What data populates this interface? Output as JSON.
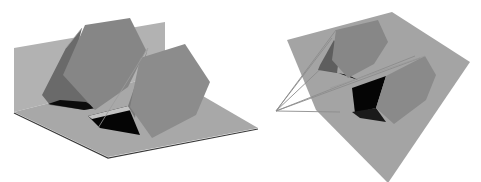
{
  "figure": {
    "colors": {
      "background": "#ffffff",
      "plane": "#a6a6a6",
      "plane_back": "#b4b4b4",
      "prism_face": "#8a8a8a",
      "prism_side": "#6e6e6e",
      "prism_dark": "#575757",
      "shadow": "#000000",
      "edge_line": "#9a9a9a"
    },
    "panels": [
      {
        "id": "left",
        "content": "two hexagonal prisms on an L-shaped ground/back plane with shadows"
      },
      {
        "id": "right",
        "content": "two hexagonal prisms on a tilted plane with projection lines converging to a point"
      }
    ]
  }
}
